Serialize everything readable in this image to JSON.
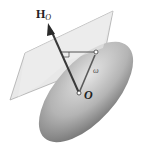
{
  "figure": {
    "labels": {
      "angular_momentum": "H",
      "angular_momentum_sub": "O",
      "origin": "O",
      "angular_velocity": "ω"
    },
    "colors": {
      "plane_fill": "#e6e6e6",
      "plane_stroke": "#9a9a9a",
      "ellipsoid_light": "#e2e2e2",
      "ellipsoid_dark": "#6e6e6e",
      "vector": "#3a3a3a"
    }
  }
}
